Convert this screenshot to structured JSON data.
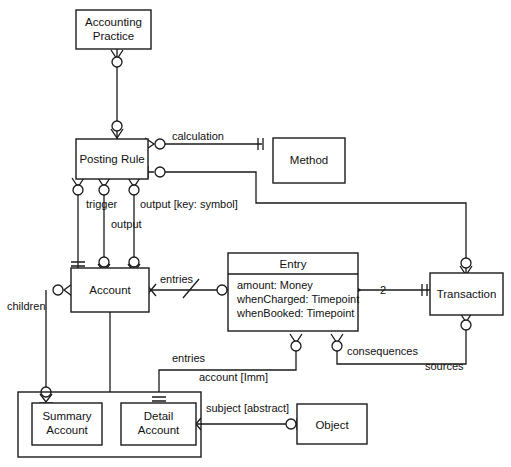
{
  "diagram": {
    "kind": "uml-class-diagram",
    "stroke_color": "#1a1a1a",
    "background_color": "#ffffff"
  },
  "classes": {
    "accounting_practice": {
      "name_line1": "Accounting",
      "name_line2": "Practice"
    },
    "posting_rule": {
      "name": "Posting  Rule"
    },
    "method": {
      "name": "Method"
    },
    "account": {
      "name": "Account"
    },
    "entry": {
      "name": "Entry",
      "attributes": [
        "amount:  Money",
        "whenCharged:  Timepoint",
        "whenBooked:  Timepoint"
      ]
    },
    "transaction": {
      "name": "Transaction"
    },
    "summary_account": {
      "name_line1": "Summary",
      "name_line2": "Account"
    },
    "detail_account": {
      "name_line1": "Detail",
      "name_line2": "Account"
    },
    "object": {
      "name": "Object"
    }
  },
  "edge_labels": {
    "calculation": "calculation",
    "trigger": "trigger",
    "output": "output",
    "output_key_symbol": "output [key: symbol]",
    "children": "children",
    "entries_account": "entries",
    "entries_detail": "entries",
    "account_imm": "account  [Imm]",
    "consequences": "consequences",
    "sources": "sources",
    "subject_abstract": "subject  [abstract]"
  },
  "multiplicities": {
    "entry_to_transaction": "2"
  }
}
